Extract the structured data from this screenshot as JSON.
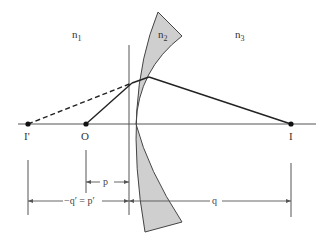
{
  "diagram": {
    "type": "optics-refraction-thin-lens",
    "media": [
      {
        "id": "n1",
        "label": "n",
        "subscript": "1"
      },
      {
        "id": "n2",
        "label": "n",
        "subscript": "2"
      },
      {
        "id": "n3",
        "label": "n",
        "subscript": "3"
      }
    ],
    "points": {
      "image_prime": "I'",
      "object": "O",
      "image": "I"
    },
    "dimensions": {
      "p": "p",
      "q_prime_eq_p_prime": "−q′ = p′",
      "q": "q"
    },
    "colors": {
      "lens_fill": "#cfcfcf",
      "lens_stroke": "#444444",
      "ray": "#222222",
      "axis": "#555555",
      "dimension": "#555555"
    }
  }
}
